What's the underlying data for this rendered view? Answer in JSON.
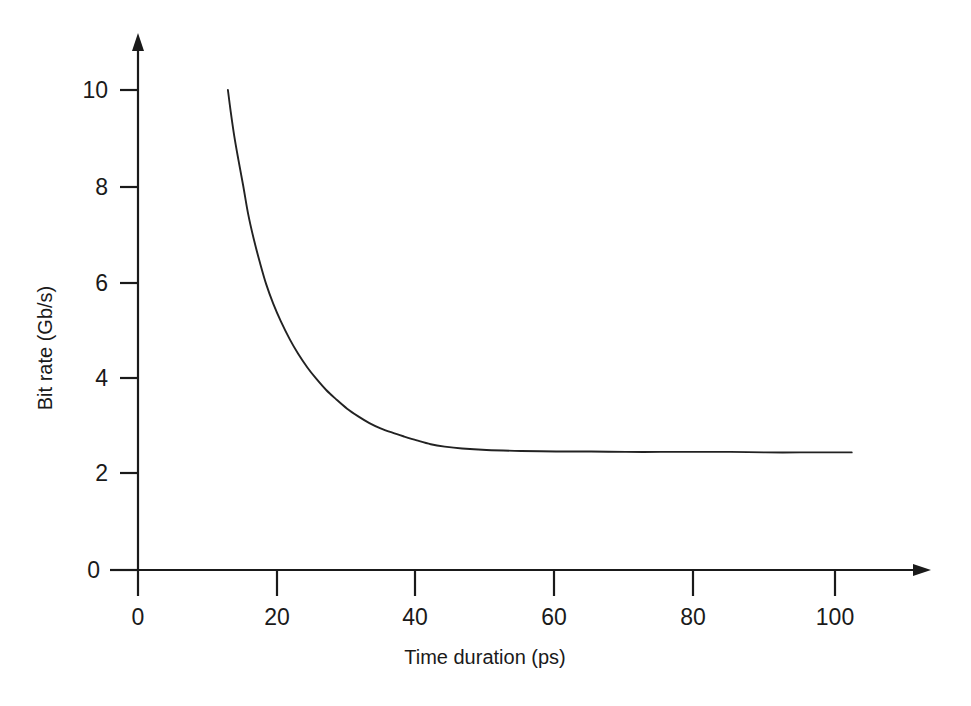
{
  "chart_data": {
    "type": "line",
    "title": "",
    "xlabel": "Time duration (ps)",
    "ylabel": "Bit rate (Gb/s)",
    "xlim": [
      0,
      105
    ],
    "ylim": [
      0,
      10.8
    ],
    "xticks": [
      0,
      20,
      40,
      60,
      80,
      100
    ],
    "xtick_labels": [
      "0",
      "20",
      "40",
      "60",
      "80",
      "100"
    ],
    "yticks": [
      0,
      2,
      4,
      6,
      8,
      10
    ],
    "ytick_labels": [
      "0",
      "2",
      "4",
      "6",
      "8",
      "10"
    ],
    "grid": false,
    "legend": null,
    "legend_position": "none",
    "axis_style": "two-sided-arrows",
    "series": [
      {
        "name": "Bit rate",
        "color": "#222222",
        "line_width": 1.9,
        "asymptote": 2.45,
        "x": [
          12.9,
          13.3,
          13.8,
          14.4,
          15.1,
          15.8,
          16.6,
          17.5,
          18.4,
          19.4,
          20.5,
          21.8,
          23.0,
          24.3,
          25.6,
          27.0,
          28.4,
          30.0,
          31.6,
          33.2,
          34.8,
          36.5,
          38.2,
          40.0,
          42.0,
          44.0,
          46.5,
          50.0,
          55.0,
          60.0,
          65.0,
          70.0,
          75.0,
          80.0,
          85.0,
          90.0,
          95.0,
          100.0,
          102.4
        ],
        "y": [
          10.0,
          9.55,
          9.05,
          8.55,
          8.0,
          7.42,
          6.9,
          6.4,
          5.95,
          5.55,
          5.18,
          4.8,
          4.5,
          4.22,
          3.98,
          3.75,
          3.56,
          3.36,
          3.2,
          3.06,
          2.95,
          2.86,
          2.78,
          2.7,
          2.62,
          2.57,
          2.53,
          2.5,
          2.48,
          2.47,
          2.47,
          2.46,
          2.46,
          2.46,
          2.46,
          2.45,
          2.45,
          2.45,
          2.45
        ]
      }
    ],
    "annotations": []
  },
  "figure": {
    "background_color": "#ffffff",
    "foreground_color": "#1a1a1a"
  }
}
